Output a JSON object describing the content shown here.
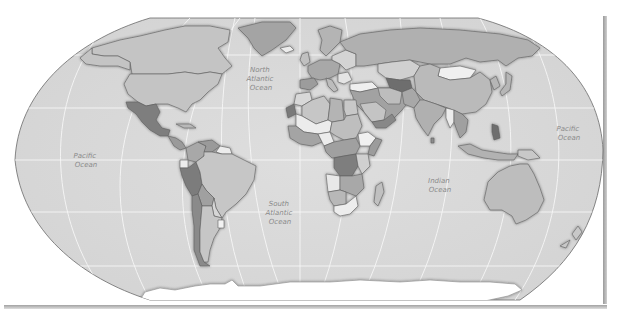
{
  "map": {
    "projection": "Robinson",
    "style": "grayscale political world map",
    "colors": {
      "ocean": "#dcdcdc",
      "graticule": "#f4f4f4",
      "border": "#5e5e5e",
      "land_light": "#ececec",
      "land_mid_light": "#c8c8c8",
      "land_mid": "#b4b4b4",
      "land_mid_dark": "#9a9a9a",
      "land_dark": "#7c7c7c",
      "antarctica": "#ffffff",
      "label": "#8a8a8a"
    },
    "ocean_labels": [
      {
        "id": "north-atlantic",
        "lines": [
          "North",
          "Atlantic",
          "Ocean"
        ]
      },
      {
        "id": "pacific-west",
        "lines": [
          "Pacific",
          "Ocean"
        ]
      },
      {
        "id": "south-atlantic",
        "lines": [
          "South",
          "Atlantic",
          "Ocean"
        ]
      },
      {
        "id": "indian",
        "lines": [
          "Indian",
          "Ocean"
        ]
      },
      {
        "id": "pacific-east",
        "lines": [
          "Pacific",
          "Ocean"
        ]
      }
    ]
  }
}
